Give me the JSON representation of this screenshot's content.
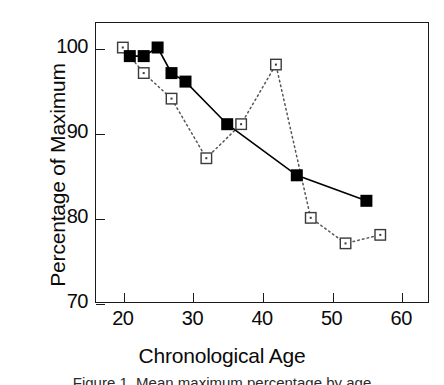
{
  "chart_data": {
    "type": "line",
    "title": "",
    "xlabel": "Chronological Age",
    "ylabel": "Percentage of Maximum",
    "xlim": [
      16,
      64
    ],
    "ylim": [
      70,
      103
    ],
    "xticks": [
      20,
      30,
      40,
      50,
      60
    ],
    "yticks": [
      70,
      80,
      90,
      100
    ],
    "xtick_labels": [
      "20",
      "30",
      "40",
      "50",
      "60"
    ],
    "ytick_labels": [
      "70",
      "80",
      "90",
      "100"
    ],
    "grid": false,
    "legend": "none",
    "series": [
      {
        "name": "filled-square-series",
        "marker": "filled-square",
        "linestyle": "solid",
        "color": "#000000",
        "x": [
          21,
          23,
          25,
          27,
          29,
          35,
          45,
          55
        ],
        "values": [
          99,
          99,
          100,
          97,
          96,
          91,
          85,
          82
        ]
      },
      {
        "name": "open-square-series",
        "marker": "open-square",
        "linestyle": "dotted",
        "color": "#555555",
        "x": [
          20,
          23,
          27,
          32,
          37,
          42,
          47,
          52,
          57
        ],
        "values": [
          100,
          97,
          94,
          87,
          91,
          98,
          80,
          77,
          78
        ]
      }
    ]
  },
  "axes": {
    "y_title": "Percentage of Maximum",
    "x_title": "Chronological Age"
  },
  "caption": {
    "text": "Figure 1. Mean maximum percentage by age"
  }
}
